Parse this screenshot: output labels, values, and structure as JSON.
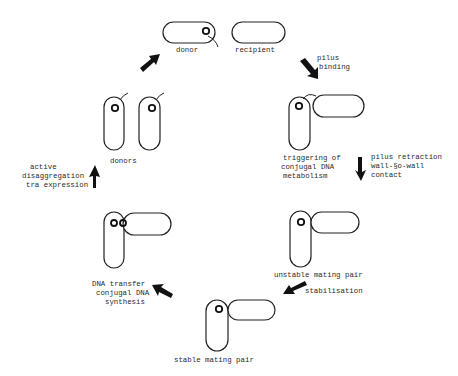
{
  "diagram": {
    "stages": [
      {
        "id": "donor-recipient",
        "labels": [
          "donor",
          "recipient"
        ]
      },
      {
        "id": "pilus-binding-step",
        "caption": [
          "pilus",
          "binding"
        ]
      },
      {
        "id": "triggering",
        "caption": [
          "triggering of",
          "conjugal DNA",
          "metabolism"
        ]
      },
      {
        "id": "retraction-step",
        "caption": [
          "pilus retraction",
          "wall-§o-wall",
          "contact"
        ]
      },
      {
        "id": "unstable-pair",
        "caption": [
          "unstable mating pair"
        ]
      },
      {
        "id": "stabilisation-step",
        "caption": [
          "stabilisation"
        ]
      },
      {
        "id": "stable-pair",
        "caption": [
          "stable mating pair"
        ]
      },
      {
        "id": "transfer-step",
        "caption": [
          "DNA transfer",
          "conjugal DNA",
          "synthesis"
        ]
      },
      {
        "id": "disaggregation-step",
        "caption": [
          "active",
          "disaggregation",
          "tra expression"
        ]
      },
      {
        "id": "donors",
        "caption": [
          "donors"
        ]
      }
    ],
    "colors": {
      "ink": "#111111",
      "background": "#ffffff"
    }
  }
}
